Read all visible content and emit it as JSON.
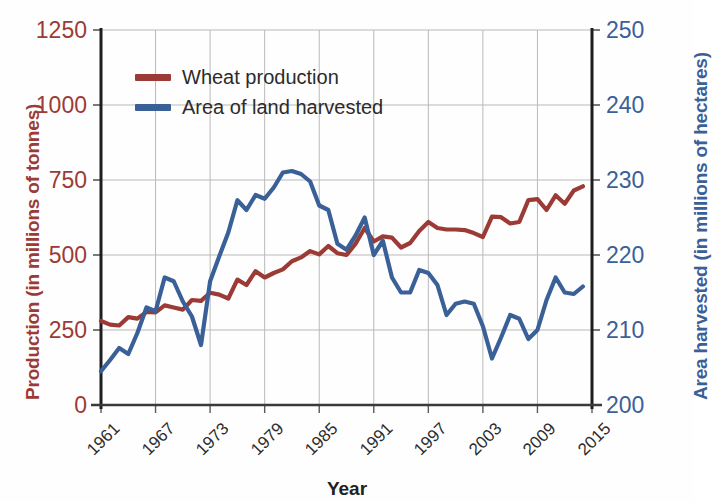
{
  "chart_data": {
    "type": "line",
    "title": "",
    "xlabel": "Year",
    "ylabel": "Production (in millions of tonnes)",
    "ylabel_right": "Area harvested (in millions of hectares)",
    "grid": true,
    "legend_position": "top-left",
    "xlim": [
      1961,
      2015
    ],
    "xticks": [
      "1961",
      "1967",
      "1973",
      "1979",
      "1985",
      "1991",
      "1997",
      "2003",
      "2009",
      "2015"
    ],
    "ylim_left": [
      0,
      1250
    ],
    "yticks_left": [
      "0",
      "250",
      "500",
      "750",
      "1000",
      "1250"
    ],
    "ylim_right": [
      200,
      250
    ],
    "yticks_right": [
      "200",
      "210",
      "220",
      "230",
      "240",
      "250"
    ],
    "x": [
      1961,
      1962,
      1963,
      1964,
      1965,
      1966,
      1967,
      1968,
      1969,
      1970,
      1971,
      1972,
      1973,
      1974,
      1975,
      1976,
      1977,
      1978,
      1979,
      1980,
      1981,
      1982,
      1983,
      1984,
      1985,
      1986,
      1987,
      1988,
      1989,
      1990,
      1991,
      1992,
      1993,
      1994,
      1995,
      1996,
      1997,
      1998,
      1999,
      2000,
      2001,
      2002,
      2003,
      2004,
      2005,
      2006,
      2007,
      2008,
      2009,
      2010,
      2011,
      2012,
      2013,
      2014
    ],
    "series": [
      {
        "name": "Wheat production",
        "axis": "left",
        "unit": "millions of tonnes",
        "color": "#9c3a35",
        "values": [
          280,
          268,
          265,
          293,
          288,
          310,
          309,
          332,
          325,
          318,
          350,
          347,
          374,
          368,
          355,
          418,
          400,
          446,
          425,
          440,
          452,
          479,
          492,
          513,
          502,
          530,
          506,
          500,
          538,
          590,
          545,
          562,
          558,
          525,
          540,
          580,
          610,
          590,
          585,
          585,
          583,
          573,
          560,
          628,
          626,
          605,
          610,
          683,
          686,
          650,
          699,
          671,
          715,
          729
        ]
      },
      {
        "name": "Area of land harvested",
        "axis": "right",
        "unit": "millions of hectares",
        "color": "#3a6098",
        "values": [
          204.5,
          206.0,
          207.6,
          206.8,
          209.6,
          213.0,
          212.5,
          217.0,
          216.5,
          213.8,
          211.8,
          208.0,
          216.5,
          219.8,
          223.0,
          227.3,
          226.0,
          228.0,
          227.5,
          229.0,
          231.0,
          231.2,
          230.8,
          229.8,
          226.6,
          226.0,
          221.5,
          220.7,
          222.6,
          225.0,
          220.0,
          221.9,
          217.0,
          215.0,
          215.0,
          218.0,
          217.6,
          216.0,
          212.0,
          213.5,
          213.8,
          213.5,
          210.5,
          206.2,
          209.0,
          212.0,
          211.5,
          208.8,
          210.0,
          214.0,
          217.0,
          215.0,
          214.8,
          215.8
        ]
      }
    ]
  },
  "legend": {
    "items": [
      {
        "label": "Wheat production",
        "color": "#9c3a35"
      },
      {
        "label": "Area of land harvested",
        "color": "#3a6098"
      }
    ]
  },
  "axes": {
    "left_title": "Production (in millions of tonnes)",
    "right_title": "Area harvested (in millions of hectares)",
    "x_title": "Year"
  }
}
